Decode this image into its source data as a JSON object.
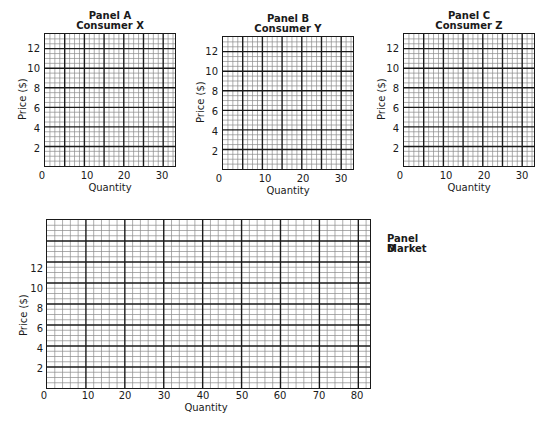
{
  "chart_data": [
    {
      "type": "table",
      "id": "A",
      "title": "Panel A",
      "subtitle": "Consumer X",
      "xlabel": "Quantity",
      "ylabel": "Price ($)",
      "xlim": [
        0,
        33
      ],
      "ylim": [
        0,
        13.5
      ],
      "xticks": [
        0,
        10,
        20,
        30
      ],
      "yticks": [
        2,
        4,
        6,
        8,
        10,
        12
      ],
      "grid": true,
      "series": []
    },
    {
      "type": "table",
      "id": "B",
      "title": "Panel B",
      "subtitle": "Consumer Y",
      "xlabel": "Quantity",
      "ylabel": "Price ($)",
      "xlim": [
        0,
        33
      ],
      "ylim": [
        0,
        13.5
      ],
      "xticks": [
        0,
        10,
        20,
        30
      ],
      "yticks": [
        2,
        4,
        6,
        8,
        10,
        12
      ],
      "grid": true,
      "series": []
    },
    {
      "type": "table",
      "id": "C",
      "title": "Panel C",
      "subtitle": "Consumer Z",
      "xlabel": "Quantity",
      "ylabel": "Price ($)",
      "xlim": [
        0,
        33
      ],
      "ylim": [
        0,
        13.5
      ],
      "xticks": [
        0,
        10,
        20,
        30
      ],
      "yticks": [
        2,
        4,
        6,
        8,
        10,
        12
      ],
      "grid": true,
      "series": []
    },
    {
      "type": "table",
      "id": "D",
      "title": "Panel D",
      "subtitle": "Market",
      "xlabel": "Quantity",
      "ylabel": "Price ($)",
      "xlim": [
        0,
        83
      ],
      "ylim": [
        0,
        16
      ],
      "xticks": [
        0,
        10,
        20,
        30,
        40,
        50,
        60,
        70,
        80
      ],
      "yticks": [
        2,
        4,
        6,
        8,
        10,
        12
      ],
      "grid": true,
      "series": []
    }
  ],
  "panels": {
    "a": {
      "title": "Panel A",
      "subtitle": "Consumer X",
      "xlabel": "Quantity",
      "ylabel": "Price ($)",
      "xticks": [
        "0",
        "10",
        "20",
        "30"
      ],
      "yticks": [
        "12",
        "10",
        "8",
        "6",
        "4",
        "2"
      ]
    },
    "b": {
      "title": "Panel B",
      "subtitle": "Consumer Y",
      "xlabel": "Quantity",
      "ylabel": "Price ($)",
      "xticks": [
        "0",
        "10",
        "20",
        "30"
      ],
      "yticks": [
        "12",
        "10",
        "8",
        "6",
        "4",
        "2"
      ]
    },
    "c": {
      "title": "Panel C",
      "subtitle": "Consumer Z",
      "xlabel": "Quantity",
      "ylabel": "Price ($)",
      "xticks": [
        "0",
        "10",
        "20",
        "30"
      ],
      "yticks": [
        "12",
        "10",
        "8",
        "6",
        "4",
        "2"
      ]
    },
    "d": {
      "title": "Panel D",
      "subtitle": "Market",
      "xlabel": "Quantity",
      "ylabel": "Price ($)",
      "xticks": [
        "0",
        "10",
        "20",
        "30",
        "40",
        "50",
        "60",
        "70",
        "80"
      ],
      "yticks": [
        "12",
        "10",
        "8",
        "6",
        "4",
        "2"
      ]
    }
  }
}
